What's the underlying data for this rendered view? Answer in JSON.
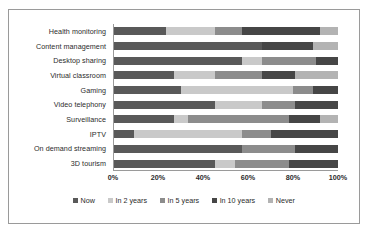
{
  "chart_data": {
    "type": "bar",
    "orientation": "horizontal",
    "stacked": true,
    "stack_mode": "percent",
    "title": "",
    "subtitle": "",
    "xlabel": "",
    "ylabel": "",
    "xlim": [
      0,
      100
    ],
    "xticks": [
      0,
      20,
      40,
      60,
      80,
      100
    ],
    "xtick_labels": [
      "0%",
      "20%",
      "40%",
      "60%",
      "80%",
      "100%"
    ],
    "grid": false,
    "legend_position": "bottom",
    "categories": [
      "Health monitoring",
      "Content management",
      "Desktop sharing",
      "Virtual classroom",
      "Gaming",
      "Video telephony",
      "Surveillance",
      "IPTV",
      "On demand streaming",
      "3D tourism"
    ],
    "series": [
      {
        "name": "Now",
        "color": "#595959",
        "values": [
          23,
          66,
          57,
          27,
          30,
          45,
          27,
          9,
          57,
          45
        ]
      },
      {
        "name": "In 2 years",
        "color": "#c9c9c9",
        "values": [
          22,
          0,
          9,
          18,
          50,
          21,
          6,
          48,
          0,
          9
        ]
      },
      {
        "name": "In 5 years",
        "color": "#8c8c8c",
        "values": [
          12,
          0,
          24,
          21,
          9,
          15,
          45,
          13,
          24,
          24
        ]
      },
      {
        "name": "In 10 years",
        "color": "#464646",
        "values": [
          35,
          23,
          10,
          15,
          11,
          19,
          14,
          30,
          19,
          22
        ]
      },
      {
        "name": "Never",
        "color": "#b3b3b3",
        "values": [
          8,
          11,
          0,
          19,
          0,
          0,
          8,
          0,
          0,
          0
        ]
      }
    ]
  },
  "legend": {
    "items": [
      {
        "label": "Now"
      },
      {
        "label": "In 2 years"
      },
      {
        "label": "In 5 years"
      },
      {
        "label": "In 10 years"
      },
      {
        "label": "Never"
      }
    ]
  }
}
